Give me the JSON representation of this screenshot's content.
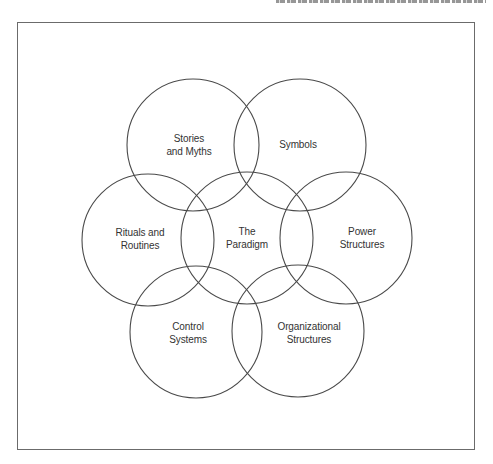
{
  "diagram": {
    "title": "",
    "stroke_color": "#4a4a4a",
    "frame_color": "#6b6b6b",
    "circle_radius": 66,
    "nodes": [
      {
        "id": "stories",
        "label": "Stories\nand Myths",
        "cx": 193,
        "cy": 145,
        "lx": 189,
        "ly": 145
      },
      {
        "id": "symbols",
        "label": "Symbols",
        "cx": 300,
        "cy": 145,
        "lx": 298,
        "ly": 145
      },
      {
        "id": "rituals",
        "label": "Rituals and\nRoutines",
        "cx": 148,
        "cy": 240,
        "lx": 140,
        "ly": 239
      },
      {
        "id": "paradigm",
        "label": "The\nParadigm",
        "cx": 247,
        "cy": 238,
        "lx": 247,
        "ly": 238
      },
      {
        "id": "power",
        "label": "Power\nStructures",
        "cx": 346,
        "cy": 238,
        "lx": 362,
        "ly": 238
      },
      {
        "id": "control",
        "label": "Control\nSystems",
        "cx": 196,
        "cy": 332,
        "lx": 188,
        "ly": 333
      },
      {
        "id": "organizational",
        "label": "Organizational\nStructures",
        "cx": 298,
        "cy": 331,
        "lx": 309,
        "ly": 333
      }
    ]
  }
}
